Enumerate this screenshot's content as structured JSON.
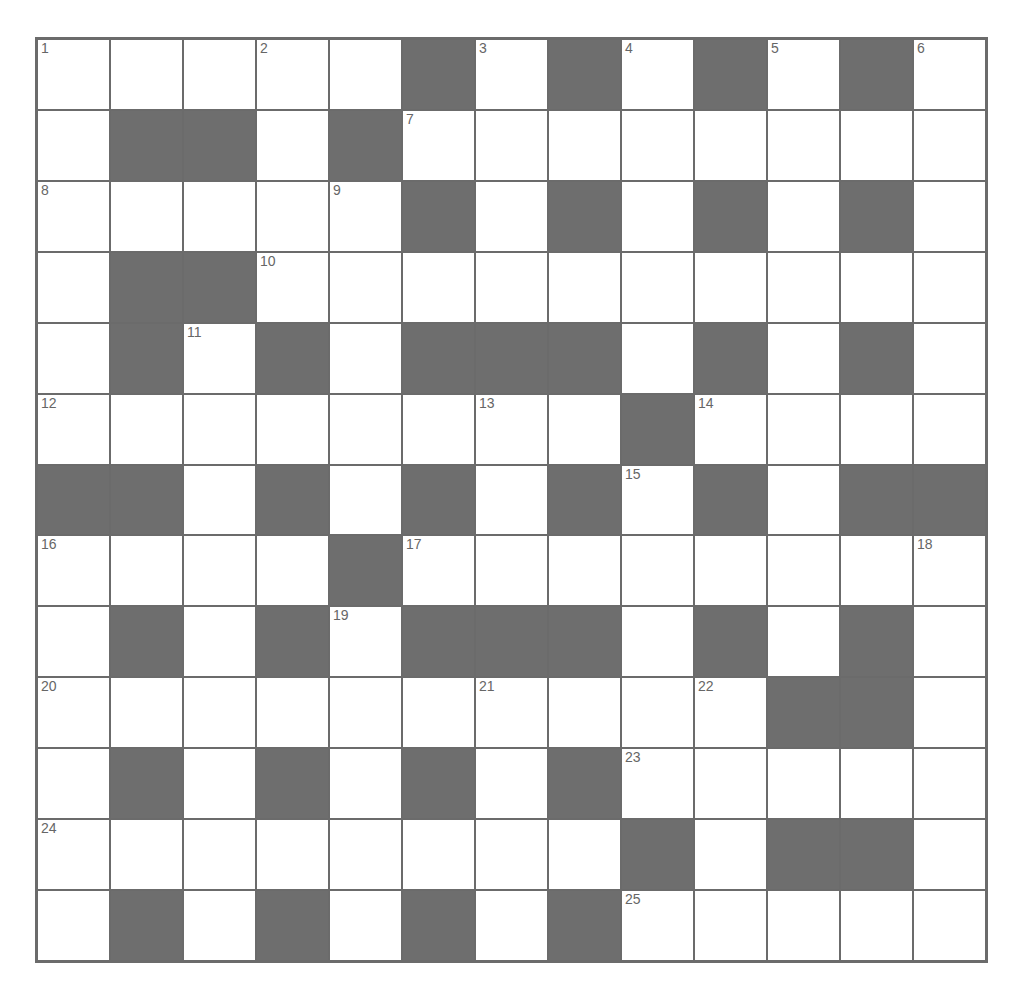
{
  "puzzle": {
    "rows": 13,
    "cols": 13,
    "colors": {
      "block": "#6e6e6e",
      "cell": "#ffffff",
      "line": "#6b6b6b"
    },
    "layout": [
      "WWWWWBWBWBWBW",
      "WBBWBWWWWWWWW",
      "WWWWWBWBWBWBW",
      "WBBWWWWWWWWWW",
      "WBWBWBBBWBWBW",
      "WWWWWWWWBWWWW",
      "BBWBWBWBWBWBB",
      "WWWWBWWWWWWWW",
      "WBWBWBBBWBWBW",
      "WWWWWWWWWWBBW",
      "WBWBWBWBWWWWW",
      "WWWWWWWWBWBBW",
      "WBWBWBWBWWWWW"
    ],
    "numbers": [
      {
        "r": 0,
        "c": 0,
        "n": "1"
      },
      {
        "r": 0,
        "c": 3,
        "n": "2"
      },
      {
        "r": 0,
        "c": 6,
        "n": "3"
      },
      {
        "r": 0,
        "c": 8,
        "n": "4"
      },
      {
        "r": 0,
        "c": 10,
        "n": "5"
      },
      {
        "r": 0,
        "c": 12,
        "n": "6"
      },
      {
        "r": 1,
        "c": 5,
        "n": "7"
      },
      {
        "r": 2,
        "c": 0,
        "n": "8"
      },
      {
        "r": 2,
        "c": 4,
        "n": "9"
      },
      {
        "r": 3,
        "c": 3,
        "n": "10"
      },
      {
        "r": 4,
        "c": 2,
        "n": "11"
      },
      {
        "r": 5,
        "c": 0,
        "n": "12"
      },
      {
        "r": 5,
        "c": 6,
        "n": "13"
      },
      {
        "r": 5,
        "c": 9,
        "n": "14"
      },
      {
        "r": 6,
        "c": 8,
        "n": "15"
      },
      {
        "r": 7,
        "c": 0,
        "n": "16"
      },
      {
        "r": 7,
        "c": 5,
        "n": "17"
      },
      {
        "r": 7,
        "c": 12,
        "n": "18"
      },
      {
        "r": 8,
        "c": 4,
        "n": "19"
      },
      {
        "r": 9,
        "c": 0,
        "n": "20"
      },
      {
        "r": 9,
        "c": 6,
        "n": "21"
      },
      {
        "r": 9,
        "c": 9,
        "n": "22"
      },
      {
        "r": 10,
        "c": 8,
        "n": "23"
      },
      {
        "r": 11,
        "c": 0,
        "n": "24"
      },
      {
        "r": 12,
        "c": 8,
        "n": "25"
      }
    ]
  }
}
